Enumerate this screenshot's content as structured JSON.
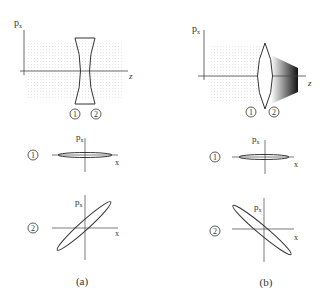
{
  "figure": {
    "top_strip_text": "…rgy spread…",
    "panels": [
      {
        "id": "a",
        "caption": "(a)",
        "lens_type": "diverging (concave)",
        "top_plot": {
          "y_axis": "p",
          "y_sub": "x",
          "x_axis": "z"
        },
        "markers": [
          "1",
          "2"
        ],
        "phase_space": [
          {
            "marker": "1",
            "y_axis": "p",
            "y_sub": "x",
            "x_axis": "x",
            "ellipse": "horizontal-thin"
          },
          {
            "marker": "2",
            "y_axis": "p",
            "y_sub": "x",
            "x_axis": "x",
            "ellipse": "tilted-positive"
          }
        ]
      },
      {
        "id": "b",
        "caption": "(b)",
        "lens_type": "converging (convex)",
        "top_plot": {
          "y_axis": "p",
          "y_sub": "x",
          "x_axis": "z"
        },
        "markers": [
          "1",
          "2"
        ],
        "phase_space": [
          {
            "marker": "1",
            "y_axis": "p",
            "y_sub": "x",
            "x_axis": "x",
            "ellipse": "horizontal-thin"
          },
          {
            "marker": "2",
            "y_axis": "p",
            "y_sub": "x",
            "x_axis": "x",
            "ellipse": "tilted-negative"
          }
        ]
      }
    ]
  }
}
